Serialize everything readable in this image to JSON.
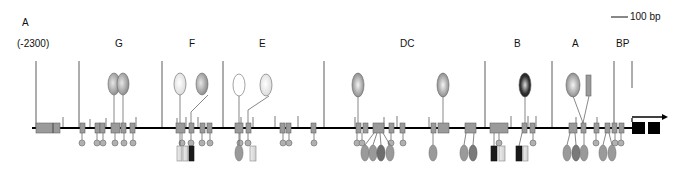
{
  "figure": {
    "panel_label": "A",
    "start_position": "(-2300)",
    "scale_bar": "100 bp",
    "regions": [
      {
        "id": "G",
        "label": "G",
        "x": 120
      },
      {
        "id": "F",
        "label": "F",
        "x": 193
      },
      {
        "id": "E",
        "label": "E",
        "x": 263
      },
      {
        "id": "DC",
        "label": "DC",
        "x": 407
      },
      {
        "id": "B",
        "label": "B",
        "x": 518
      },
      {
        "id": "A",
        "label": "A",
        "x": 576
      },
      {
        "id": "BP",
        "label": "BP",
        "x": 622
      }
    ],
    "region_boundaries_x": [
      36,
      79,
      162,
      224,
      324,
      485,
      552,
      614,
      632
    ],
    "dna_line": {
      "y": 128,
      "x_start": 32,
      "x_end": 632
    },
    "start_box_x": [
      36,
      60
    ],
    "exons_x": [
      632,
      650
    ],
    "transcription_start": "arrow"
  },
  "colors": {
    "site": "#9a9a9a",
    "dark": "#1a1a1a",
    "light": "#e8e8e8",
    "oval_mid": "#a8a8a8"
  }
}
